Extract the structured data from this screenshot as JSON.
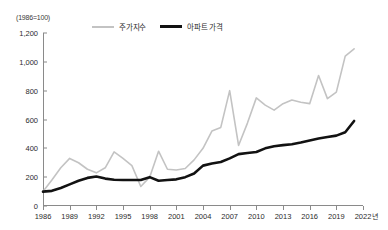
{
  "figure": {
    "unit_note": "(1986=100)",
    "x_axis_unit": "년",
    "colors": {
      "stock_line": "#c3c3c3",
      "apartment_line": "#121212",
      "axis": "#8a8a8a",
      "text": "#2b2b2b"
    }
  },
  "legend": {
    "position": "top-center",
    "items": [
      {
        "label": "주가지수",
        "style": "thin-gray-line",
        "color": "#c3c3c3"
      },
      {
        "label": "아파트 가격",
        "style": "thick-black-line",
        "color": "#121212"
      }
    ]
  },
  "chart_data": {
    "type": "line",
    "title": "",
    "subtitle": "(1986=100)",
    "xlabel": "년",
    "ylabel": "",
    "ylim": [
      0,
      1200
    ],
    "xlim": [
      1986,
      2022
    ],
    "grid": false,
    "legend_position": "top-center",
    "ytick_labels": [
      "0",
      "200",
      "400",
      "600",
      "800",
      "1,000",
      "1,200"
    ],
    "ytick_values": [
      0,
      200,
      400,
      600,
      800,
      1000,
      1200
    ],
    "xtick_labels": [
      "1986",
      "1989",
      "1992",
      "1995",
      "1998",
      "2001",
      "2004",
      "2007",
      "2010",
      "2013",
      "2016",
      "2019",
      "2022"
    ],
    "xtick_values": [
      1986,
      1989,
      1992,
      1995,
      1998,
      2001,
      2004,
      2007,
      2010,
      2013,
      2016,
      2019,
      2022
    ],
    "x": [
      1986,
      1987,
      1988,
      1989,
      1990,
      1991,
      1992,
      1993,
      1994,
      1995,
      1996,
      1997,
      1998,
      1999,
      2000,
      2001,
      2002,
      2003,
      2004,
      2005,
      2006,
      2007,
      2008,
      2009,
      2010,
      2011,
      2012,
      2013,
      2014,
      2015,
      2016,
      2017,
      2018,
      2019,
      2020,
      2021
    ],
    "series": [
      {
        "name": "주가지수",
        "color": "#c3c3c3",
        "values": [
          100,
          180,
          265,
          330,
          300,
          255,
          230,
          265,
          375,
          330,
          280,
          135,
          200,
          380,
          255,
          250,
          260,
          320,
          400,
          520,
          545,
          800,
          420,
          575,
          750,
          700,
          665,
          710,
          735,
          720,
          710,
          905,
          745,
          790,
          1040,
          1090
        ]
      },
      {
        "name": "아파트 가격",
        "color": "#121212",
        "values": [
          100,
          105,
          125,
          150,
          175,
          195,
          205,
          190,
          182,
          180,
          180,
          180,
          200,
          175,
          180,
          185,
          200,
          225,
          280,
          295,
          305,
          330,
          360,
          368,
          375,
          400,
          415,
          422,
          428,
          440,
          455,
          468,
          478,
          488,
          512,
          590
        ]
      }
    ]
  }
}
